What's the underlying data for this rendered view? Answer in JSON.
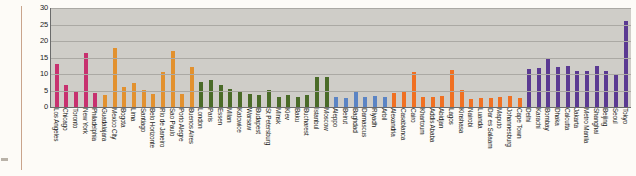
{
  "chart_data": {
    "type": "bar",
    "title": "",
    "subtitle": "",
    "xlabel": "",
    "ylabel": "",
    "ylim": [
      0,
      30
    ],
    "yticks": [
      0,
      5,
      10,
      15,
      20,
      25,
      30
    ],
    "grid": true,
    "legend": "none",
    "plot_background": "#cfcdc8",
    "group_colors": {
      "americas_north": "#c7316f",
      "americas_latin": "#e2912f",
      "europe": "#4a6b28",
      "middle_east": "#5b84c4",
      "africa": "#f07022",
      "asia": "#5b3a92"
    },
    "categories": [
      "Los Angeles",
      "Chicago",
      "Toronto",
      "New York",
      "Philadelphia",
      "Guadalajara",
      "Mexico City",
      "Bogota",
      "Lima",
      "Santiago",
      "Belo Horizonte",
      "Rio de Janeiro",
      "Sao Paulo",
      "Porto Alegre",
      "Buenos Aires",
      "London",
      "Paris",
      "Essen",
      "Milan",
      "Katowice",
      "Warsaw",
      "Budapest",
      "St Petersburg",
      "Minsk",
      "Kiev",
      "Baku",
      "Bucharest",
      "Istanbul",
      "Moscow",
      "Aleppo",
      "Beirut",
      "Baghdad",
      "Damascus",
      "Riyadh",
      "Arbil",
      "Alexandria",
      "Casablanca",
      "Cairo",
      "Khartoum",
      "Addis Ababa",
      "Abidjan",
      "Lagos",
      "Kinshasa",
      "Nairobi",
      "Luanda",
      "Dar es Salaam",
      "Maputo",
      "Johannesburg",
      "Cape Town",
      "Delhi",
      "Karachi",
      "Bombay",
      "Dhaka",
      "Calcutta",
      "Jakarta",
      "Metro Manila",
      "Shanghai",
      "Beijing",
      "Seoul",
      "Tokyo"
    ],
    "values": [
      13.0,
      6.8,
      4.4,
      16.4,
      4.2,
      3.5,
      18.0,
      6.1,
      7.2,
      5.2,
      3.9,
      10.5,
      17.0,
      3.8,
      12.0,
      7.5,
      8.2,
      6.6,
      5.4,
      4.7,
      3.8,
      3.5,
      5.2,
      3.0,
      3.6,
      3.0,
      3.5,
      9.0,
      9.0,
      3.0,
      2.6,
      4.5,
      3.0,
      3.4,
      2.9,
      4.2,
      4.6,
      10.5,
      2.9,
      3.0,
      3.3,
      11.2,
      5.3,
      2.4,
      2.8,
      2.6,
      3.1,
      3.3,
      2.7,
      11.4,
      11.8,
      15.0,
      12.0,
      12.3,
      11.0,
      11.0,
      12.4,
      11.0,
      10.1,
      26.0
    ],
    "bar_colors": [
      "#c7316f",
      "#c7316f",
      "#c7316f",
      "#c7316f",
      "#c7316f",
      "#e2912f",
      "#e2912f",
      "#e2912f",
      "#e2912f",
      "#e2912f",
      "#e2912f",
      "#e2912f",
      "#e2912f",
      "#e2912f",
      "#e2912f",
      "#4a6b28",
      "#4a6b28",
      "#4a6b28",
      "#4a6b28",
      "#4a6b28",
      "#4a6b28",
      "#4a6b28",
      "#4a6b28",
      "#4a6b28",
      "#4a6b28",
      "#4a6b28",
      "#4a6b28",
      "#4a6b28",
      "#4a6b28",
      "#5b84c4",
      "#5b84c4",
      "#5b84c4",
      "#5b84c4",
      "#5b84c4",
      "#5b84c4",
      "#f07022",
      "#f07022",
      "#f07022",
      "#f07022",
      "#f07022",
      "#f07022",
      "#f07022",
      "#f07022",
      "#f07022",
      "#f07022",
      "#f07022",
      "#f07022",
      "#f07022",
      "#f07022",
      "#5b3a92",
      "#5b3a92",
      "#5b3a92",
      "#5b3a92",
      "#5b3a92",
      "#5b3a92",
      "#5b3a92",
      "#5b3a92",
      "#5b3a92",
      "#5b3a92",
      "#5b3a92"
    ]
  }
}
